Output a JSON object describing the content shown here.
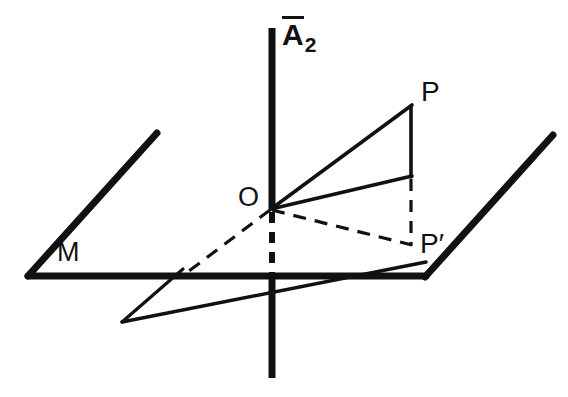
{
  "figure": {
    "background_color": "#ffffff",
    "stroke_color": "#111111",
    "width": 568,
    "height": 397,
    "labels": {
      "axis_base": "A",
      "axis_overbar": true,
      "axis_subscript": "2",
      "origin": "O",
      "point_p": "P",
      "point_p_projection": "P′",
      "plane": "M"
    },
    "geometry": {
      "vertical_axis": {
        "x": 272,
        "y_top": 28,
        "y_bottom": 378,
        "solid_upper": [
          28,
          208
        ],
        "dashed_middle": [
          208,
          277
        ],
        "solid_lower": [
          277,
          378
        ]
      },
      "plane_edges": {
        "horizontal": {
          "x1": 28,
          "y1": 276,
          "x2": 425,
          "y2": 276
        },
        "left_diagonal": {
          "x1": 28,
          "y1": 276,
          "x2": 157,
          "y2": 133
        },
        "right_diagonal": {
          "x1": 425,
          "y1": 276,
          "x2": 553,
          "y2": 135
        }
      },
      "points": {
        "O": [
          272,
          208
        ],
        "P": [
          411,
          106
        ],
        "P_foot": [
          411,
          176
        ],
        "P_prime": [
          411,
          245
        ],
        "V_vertex": [
          122,
          322
        ]
      },
      "solid_rays": [
        {
          "name": "O-to-P",
          "from": [
            272,
            208
          ],
          "to": [
            411,
            106
          ]
        },
        {
          "name": "O-to-P-foot",
          "from": [
            272,
            208
          ],
          "to": [
            411,
            176
          ]
        },
        {
          "name": "P-vertical",
          "from": [
            411,
            106
          ],
          "to": [
            411,
            176
          ]
        },
        {
          "name": "V-short-ray",
          "from": [
            122,
            322
          ],
          "to": [
            182,
            270
          ]
        },
        {
          "name": "V-long-ray",
          "from": [
            122,
            322
          ],
          "to": [
            425,
            262
          ]
        }
      ],
      "dashed_rays": [
        {
          "name": "O-to-plane-left",
          "from": [
            272,
            208
          ],
          "to": [
            186,
            273
          ]
        },
        {
          "name": "O-to-P-prime",
          "from": [
            272,
            208
          ],
          "to": [
            411,
            245
          ]
        },
        {
          "name": "P-prime-vertical",
          "from": [
            411,
            178
          ],
          "to": [
            411,
            245
          ]
        }
      ]
    }
  }
}
